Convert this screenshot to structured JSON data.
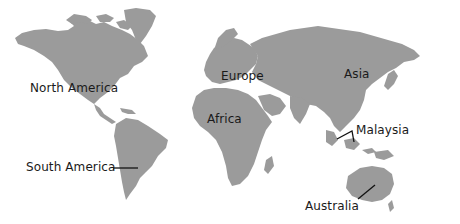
{
  "map": {
    "title": "World map with labeled regions",
    "land_color": "#9b9b9b",
    "background_color": "#ffffff",
    "label_color": "#1a1a1a",
    "labels": [
      {
        "id": "north-america",
        "text": "North America",
        "x": 30,
        "y": 82
      },
      {
        "id": "europe",
        "text": "Europe",
        "x": 221,
        "y": 70
      },
      {
        "id": "asia",
        "text": "Asia",
        "x": 344,
        "y": 68
      },
      {
        "id": "africa",
        "text": "Africa",
        "x": 207,
        "y": 113
      },
      {
        "id": "south-america",
        "text": "South America",
        "x": 26,
        "y": 161
      },
      {
        "id": "malaysia",
        "text": "Malaysia",
        "x": 356,
        "y": 124
      },
      {
        "id": "australia",
        "text": "Australia",
        "x": 305,
        "y": 200
      }
    ],
    "leader_lines": [
      {
        "for": "south-america",
        "points": "113,168 138,168"
      },
      {
        "for": "malaysia",
        "points": "337,139 352,131 354,142"
      },
      {
        "for": "australia",
        "points": "358,199 375,185"
      }
    ]
  }
}
